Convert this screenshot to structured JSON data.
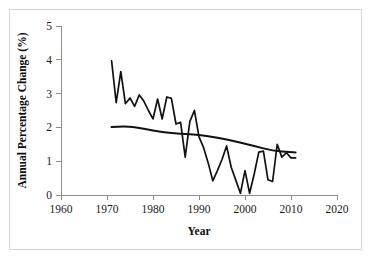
{
  "chart_data": {
    "type": "line",
    "title": "",
    "xlabel": "Year",
    "ylabel": "Annual Percentage Change (%)",
    "xlim": [
      1960,
      2020
    ],
    "ylim": [
      0,
      5
    ],
    "xticks": [
      1960,
      1970,
      1980,
      1990,
      2000,
      2010,
      2020
    ],
    "xtick_labels": [
      "1960",
      "1970",
      "1980",
      "1990",
      "2000",
      "2010",
      "2020"
    ],
    "yticks": [
      0,
      1,
      2,
      3,
      4,
      5
    ],
    "ytick_labels": [
      "0",
      "1",
      "2",
      "3",
      "4",
      "5"
    ],
    "grid": false,
    "legend": "none",
    "line_color": "#111111",
    "axis_color": "#8c8c8c",
    "background": "#ffffff",
    "series": [
      {
        "name": "Annual percentage change",
        "style": "jagged",
        "x": [
          1971,
          1972,
          1973,
          1974,
          1975,
          1976,
          1977,
          1978,
          1979,
          1980,
          1981,
          1982,
          1983,
          1984,
          1985,
          1986,
          1987,
          1988,
          1989,
          1990,
          1991,
          1992,
          1993,
          1994,
          1995,
          1996,
          1997,
          1998,
          1999,
          2000,
          2001,
          2002,
          2003,
          2004,
          2005,
          2006,
          2007,
          2008,
          2009,
          2010,
          2011
        ],
        "values": [
          3.97,
          2.73,
          3.65,
          2.7,
          2.87,
          2.62,
          2.96,
          2.78,
          2.5,
          2.25,
          2.84,
          2.25,
          2.9,
          2.86,
          2.1,
          2.15,
          1.12,
          2.17,
          2.5,
          1.72,
          1.4,
          0.95,
          0.42,
          0.72,
          1.05,
          1.45,
          0.82,
          0.44,
          0.05,
          0.72,
          0.05,
          0.62,
          1.27,
          1.3,
          0.45,
          0.4,
          1.5,
          1.12,
          1.25,
          1.1,
          1.1
        ]
      },
      {
        "name": "Smoothed trend",
        "style": "smooth",
        "x": [
          1971,
          1974,
          1978,
          1982,
          1986,
          1990,
          1994,
          1998,
          2002,
          2006,
          2010,
          2011
        ],
        "values": [
          2.01,
          2.05,
          1.96,
          1.86,
          1.81,
          1.78,
          1.7,
          1.58,
          1.45,
          1.31,
          1.27,
          1.26
        ]
      }
    ]
  }
}
